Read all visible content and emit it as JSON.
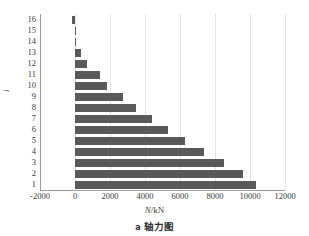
{
  "chart_data": {
    "type": "bar",
    "orientation": "horizontal",
    "title": "",
    "xlabel": "N/kN",
    "ylabel": "i",
    "categories": [
      "16",
      "15",
      "14",
      "13",
      "12",
      "11",
      "10",
      "9",
      "8",
      "7",
      "6",
      "5",
      "4",
      "3",
      "2",
      "1"
    ],
    "values": [
      -170,
      40,
      60,
      370,
      700,
      1400,
      1800,
      2750,
      3500,
      4400,
      5300,
      6300,
      7350,
      8500,
      9600,
      10350
    ],
    "xlim": [
      -2000,
      12000
    ],
    "xticks": [
      -2000,
      0,
      2000,
      4000,
      6000,
      8000,
      10000,
      12000
    ],
    "xticklabels": [
      "-2000",
      "0",
      "2000",
      "4000",
      "6000",
      "8000",
      "10000",
      "12000"
    ],
    "grid": "vertical",
    "legend": "none",
    "bar_color": "#595959",
    "grid_color": "#e2e2e2",
    "axis_color": "#9a9a9a"
  },
  "axes": {
    "x_title_symbol": "N",
    "x_title_unit": "/kN",
    "y_title": "i"
  },
  "caption": {
    "index": "a",
    "text": "轴力图"
  }
}
